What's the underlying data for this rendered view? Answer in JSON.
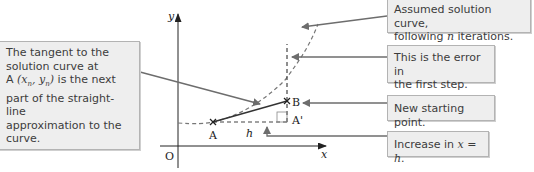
{
  "diagram": {
    "axes": {
      "x_label": "x",
      "y_label": "y",
      "origin_label": "O"
    },
    "points": [
      {
        "id": "A",
        "label": "A"
      },
      {
        "id": "B",
        "label": "B"
      },
      {
        "id": "A_prime",
        "label": "A'"
      }
    ],
    "step_label": "h"
  },
  "annotations": {
    "left": {
      "line1": "The tangent to the",
      "line2": "solution curve at",
      "line3_prefix": "A ",
      "line3_math": "(x",
      "line3_sub1": "n",
      "line3_mid": ", y",
      "line3_sub2": "n",
      "line3_close": ")",
      "line3_suffix": " is the next",
      "line4": "part of the straight-line",
      "line5": "approximation to the",
      "line6": "curve."
    },
    "curve": {
      "line1": "Assumed solution curve,",
      "line2_prefix": "following ",
      "line2_math": "n",
      "line2_suffix": " iterations."
    },
    "error": {
      "line1": "This is the error in",
      "line2": "the first step."
    },
    "new_point": {
      "text": "New starting point."
    },
    "increase": {
      "prefix": "Increase in ",
      "math": "x = h",
      "suffix": "."
    }
  },
  "colors": {
    "box_fill": "#eeeeee",
    "box_border": "#b3b3b3",
    "arrow": "#6d6d6d",
    "ink": "#222222"
  }
}
